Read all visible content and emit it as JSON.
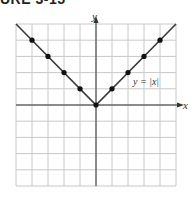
{
  "heading": "URE 3-15",
  "chart_data": {
    "type": "line",
    "title": "",
    "equation_label": "y = |x|",
    "xlabel": "x",
    "ylabel": "y",
    "xlim": [
      -5,
      5
    ],
    "ylim": [
      -5,
      5
    ],
    "grid": true,
    "grid_step": 1,
    "series": [
      {
        "name": "y = |x|",
        "line_color": "#333333",
        "x": [
          -5,
          5
        ],
        "y": [
          5,
          5
        ],
        "vertex": [
          0,
          0
        ]
      }
    ],
    "points": [
      {
        "x": -4,
        "y": 4
      },
      {
        "x": -3,
        "y": 3
      },
      {
        "x": -2,
        "y": 2
      },
      {
        "x": -1,
        "y": 1
      },
      {
        "x": 0,
        "y": 0
      },
      {
        "x": 1,
        "y": 1
      },
      {
        "x": 2,
        "y": 2
      },
      {
        "x": 3,
        "y": 3
      },
      {
        "x": 4,
        "y": 4
      }
    ],
    "colors": {
      "grid": "#c8c8c8",
      "axis": "#333333",
      "line": "#3a3a3a",
      "point": "#111111"
    }
  }
}
